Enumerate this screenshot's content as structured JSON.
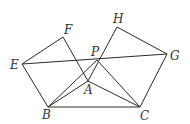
{
  "figure": {
    "type": "geometry",
    "points": {
      "E": {
        "label": "E",
        "x": 22,
        "y": 64
      },
      "F": {
        "label": "F",
        "x": 63,
        "y": 37
      },
      "B": {
        "label": "B",
        "x": 48,
        "y": 107
      },
      "A": {
        "label": "A",
        "x": 88,
        "y": 81
      },
      "P": {
        "label": "P",
        "x": 97,
        "y": 60
      },
      "H": {
        "label": "H",
        "x": 117,
        "y": 27
      },
      "G": {
        "label": "G",
        "x": 167,
        "y": 54
      },
      "C": {
        "label": "C",
        "x": 140,
        "y": 107
      }
    },
    "segments": [
      [
        "E",
        "F"
      ],
      [
        "F",
        "A"
      ],
      [
        "E",
        "B"
      ],
      [
        "B",
        "A"
      ],
      [
        "B",
        "C"
      ],
      [
        "A",
        "C"
      ],
      [
        "H",
        "G"
      ],
      [
        "G",
        "C"
      ],
      [
        "H",
        "A"
      ],
      [
        "E",
        "G"
      ],
      [
        "B",
        "P"
      ],
      [
        "P",
        "C"
      ]
    ],
    "labels": [
      "E",
      "F",
      "P",
      "H",
      "G",
      "A",
      "B",
      "C"
    ]
  }
}
